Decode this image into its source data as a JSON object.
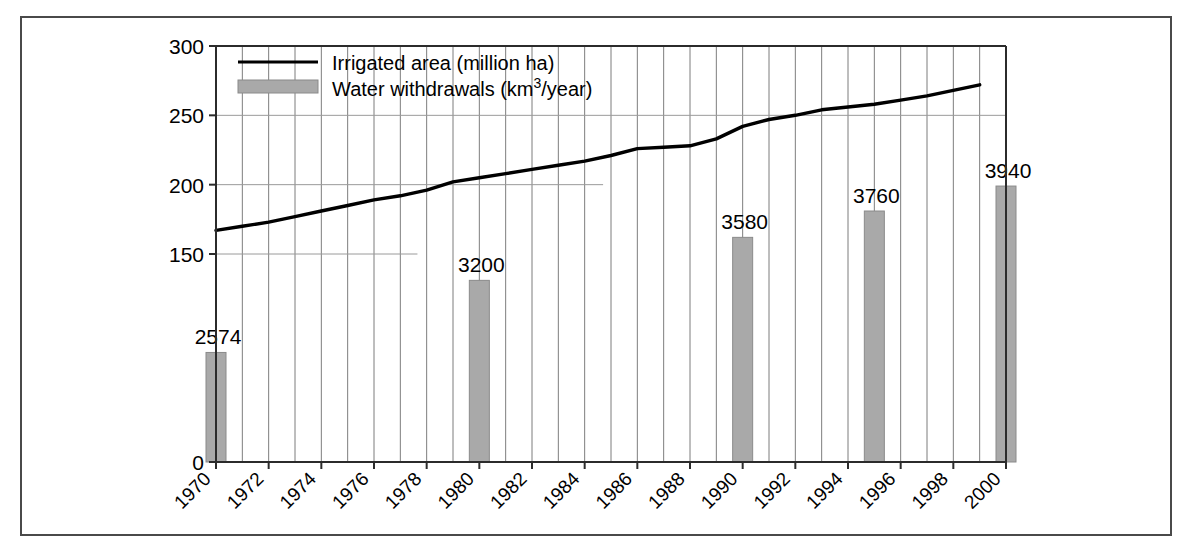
{
  "chart_data": {
    "type": "bar",
    "title": "",
    "xlabel": "",
    "ylabel": "",
    "ylim": [
      0,
      300
    ],
    "xlim": [
      1970,
      2000
    ],
    "grid": true,
    "legend_position": "top-left",
    "y_ticks": [
      "0",
      "150",
      "200",
      "250",
      "300"
    ],
    "y_tick_values": [
      0,
      150,
      200,
      250,
      300
    ],
    "x_ticks": [
      "1970",
      "1972",
      "1974",
      "1976",
      "1978",
      "1980",
      "1982",
      "1984",
      "1986",
      "1988",
      "1990",
      "1992",
      "1994",
      "1996",
      "1998",
      "2000"
    ],
    "x_tick_values": [
      1970,
      1972,
      1974,
      1976,
      1978,
      1980,
      1982,
      1984,
      1986,
      1988,
      1990,
      1992,
      1994,
      1996,
      1998,
      2000
    ],
    "series": [
      {
        "name": "Irrigated area (million ha)",
        "type": "line",
        "unit": "million ha",
        "axis": "left",
        "x": [
          1970,
          1971,
          1972,
          1973,
          1974,
          1975,
          1976,
          1977,
          1978,
          1979,
          1980,
          1981,
          1982,
          1983,
          1984,
          1985,
          1986,
          1987,
          1988,
          1989,
          1990,
          1991,
          1992,
          1993,
          1994,
          1995,
          1996,
          1997,
          1998,
          1999
        ],
        "values": [
          167,
          170,
          173,
          177,
          181,
          185,
          189,
          192,
          196,
          202,
          205,
          208,
          211,
          214,
          217,
          221,
          226,
          227,
          228,
          233,
          242,
          247,
          250,
          254,
          256,
          258,
          261,
          264,
          268,
          272
        ]
      },
      {
        "name": "Water withdrawals (km³/year)",
        "type": "bar",
        "unit": "km³/year",
        "axis": "right-implied",
        "x": [
          1970,
          1980,
          1990,
          1995,
          2000
        ],
        "values": [
          2574,
          3200,
          3580,
          3760,
          3940
        ],
        "labels": [
          "2574",
          "3200",
          "3580",
          "3760",
          "3940"
        ],
        "bar_plot_heights": [
          79,
          131,
          162,
          181,
          199
        ]
      }
    ],
    "legend": [
      {
        "label": "Irrigated area (million ha)",
        "marker": "line",
        "color": "#000000"
      },
      {
        "label": "Water withdrawals (km³/year)",
        "marker": "swatch",
        "color": "#a9a9a9"
      }
    ],
    "colors": {
      "line": "#000000",
      "bar_fill": "#a9a9a9",
      "bar_stroke": "#8a8a8a",
      "grid": "#7d7d7d",
      "axis": "#2b2b2b",
      "frame": "#4a4a4a",
      "background": "#ffffff"
    }
  }
}
